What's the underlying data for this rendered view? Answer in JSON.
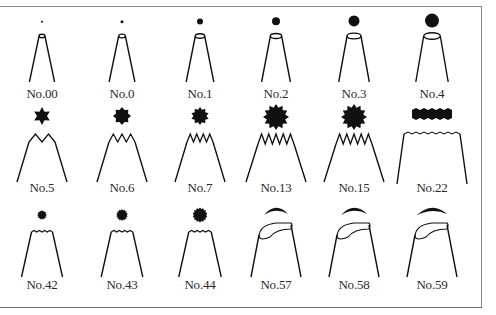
{
  "colors": {
    "ink": "#111111",
    "frame": "#8a8a8a",
    "label": "#2a2a2a"
  },
  "rows": [
    {
      "type": "round",
      "tips": [
        {
          "label": "No.00",
          "shape": "round-tip",
          "size": 1
        },
        {
          "label": "No.0",
          "shape": "round-tip",
          "size": 1.5
        },
        {
          "label": "No.1",
          "shape": "round-tip",
          "size": 3
        },
        {
          "label": "No.2",
          "shape": "round-tip",
          "size": 4
        },
        {
          "label": "No.3",
          "shape": "round-tip",
          "size": 5.5
        },
        {
          "label": "No.4",
          "shape": "round-tip",
          "size": 7
        }
      ]
    },
    {
      "type": "star",
      "tips": [
        {
          "label": "No.5",
          "shape": "star-tip",
          "points": 6
        },
        {
          "label": "No.6",
          "shape": "star-tip",
          "points": 8
        },
        {
          "label": "No.7",
          "shape": "star-tip",
          "points": 10
        },
        {
          "label": "No.13",
          "shape": "star-tip",
          "points": 12
        },
        {
          "label": "No.15",
          "shape": "star-tip",
          "points": 12
        },
        {
          "label": "No.22",
          "shape": "basketweave-tip",
          "points": 0
        }
      ]
    },
    {
      "type": "mixed",
      "tips": [
        {
          "label": "No.42",
          "shape": "fine-star-tip",
          "size": 5
        },
        {
          "label": "No.43",
          "shape": "fine-star-tip",
          "size": 6
        },
        {
          "label": "No.44",
          "shape": "fine-star-tip",
          "size": 7.5
        },
        {
          "label": "No.57",
          "shape": "petal-tip",
          "size": 1
        },
        {
          "label": "No.58",
          "shape": "petal-tip",
          "size": 1.1
        },
        {
          "label": "No.59",
          "shape": "petal-tip",
          "size": 1.3
        }
      ]
    }
  ]
}
